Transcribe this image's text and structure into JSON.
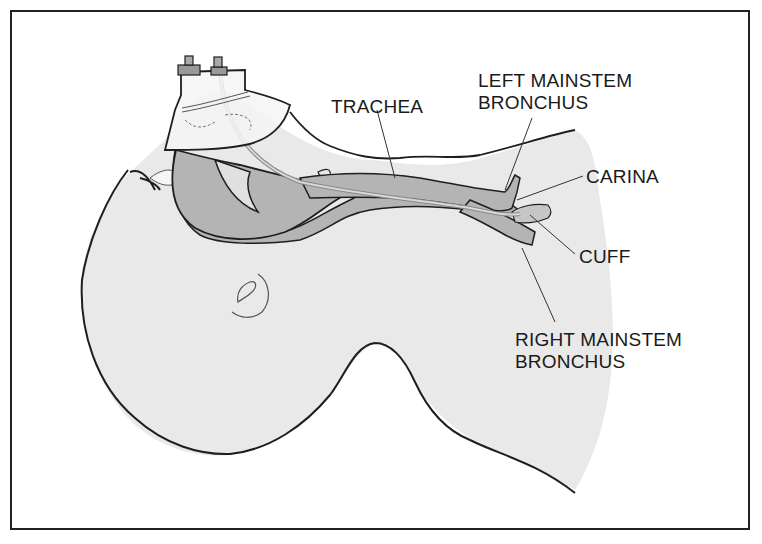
{
  "figure": {
    "colors": {
      "body_fill": "#e9e9e9",
      "airway_fill": "#b4b4b4",
      "outline": "#1e1e1e",
      "border": "#222222",
      "tube": "#d8d8d8"
    }
  },
  "labels": {
    "trachea": "TRACHEA",
    "left_mainstem_line1": "LEFT MAINSTEM",
    "left_mainstem_line2": "BRONCHUS",
    "carina": "CARINA",
    "cuff": "CUFF",
    "right_mainstem_line1": "RIGHT MAINSTEM",
    "right_mainstem_line2": "BRONCHUS"
  }
}
